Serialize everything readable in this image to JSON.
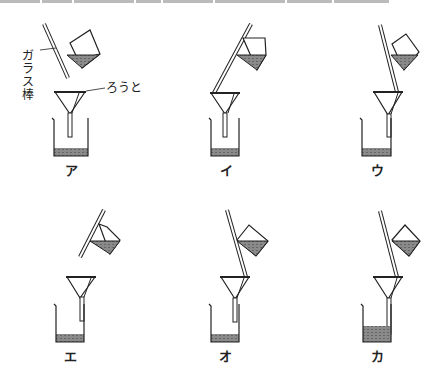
{
  "figure": {
    "annotations": {
      "glass_rod": "ガラス棒",
      "funnel": "ろうと"
    },
    "panels": [
      {
        "id": "a",
        "label": "ア",
        "rod": "tilted away, not touching funnel",
        "funnel_tip": "center of beaker"
      },
      {
        "id": "i",
        "label": "イ",
        "rod": "leaning to left side of funnel",
        "funnel_tip": "center of beaker"
      },
      {
        "id": "u",
        "label": "ウ",
        "rod": "touching filter on right side",
        "funnel_tip": "against beaker wall"
      },
      {
        "id": "e",
        "label": "エ",
        "rod": "short, above funnel, not touching",
        "funnel_tip": "against beaker wall"
      },
      {
        "id": "o",
        "label": "オ",
        "rod": "touching filter on right side",
        "funnel_tip": "center of beaker"
      },
      {
        "id": "ka",
        "label": "カ",
        "rod": "touching filter on right side",
        "funnel_tip": "against beaker wall, liquid level high"
      }
    ]
  },
  "colors": {
    "line": "#222222",
    "liquid": "#777777",
    "background": "#ffffff"
  }
}
